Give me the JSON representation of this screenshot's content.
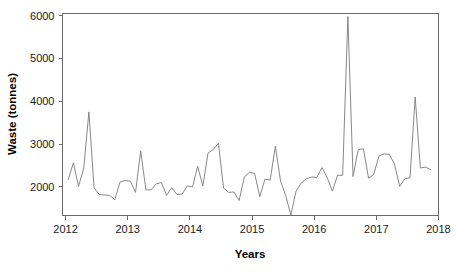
{
  "chart_data": {
    "type": "line",
    "title": "",
    "xlabel": "Years",
    "ylabel": "Waste (tonnes)",
    "xlim": [
      2011.95,
      2018.0
    ],
    "ylim": [
      1330,
      6050
    ],
    "xticks": [
      2012,
      2013,
      2014,
      2015,
      2016,
      2017,
      2018
    ],
    "xtick_labels": [
      "2012",
      "2013",
      "2014",
      "2015",
      "2016",
      "2017",
      "2018"
    ],
    "yticks": [
      2000,
      3000,
      4000,
      5000,
      6000
    ],
    "ytick_labels": [
      "2000",
      "3000",
      "4000",
      "5000",
      "6000"
    ],
    "grid": false,
    "legend": "none",
    "line_color": "#7a7a7a",
    "axis_color": "#6b6b6b",
    "series": [
      {
        "name": "Waste",
        "x": [
          2012.042,
          2012.125,
          2012.208,
          2012.292,
          2012.375,
          2012.458,
          2012.542,
          2012.625,
          2012.708,
          2012.792,
          2012.875,
          2012.958,
          2013.042,
          2013.125,
          2013.208,
          2013.292,
          2013.375,
          2013.458,
          2013.542,
          2013.625,
          2013.708,
          2013.792,
          2013.875,
          2013.958,
          2014.042,
          2014.125,
          2014.208,
          2014.292,
          2014.375,
          2014.458,
          2014.542,
          2014.625,
          2014.708,
          2014.792,
          2014.875,
          2014.958,
          2015.042,
          2015.125,
          2015.208,
          2015.292,
          2015.375,
          2015.458,
          2015.542,
          2015.625,
          2015.708,
          2015.792,
          2015.875,
          2015.958,
          2016.042,
          2016.125,
          2016.208,
          2016.292,
          2016.375,
          2016.458,
          2016.542,
          2016.625,
          2016.708,
          2016.792,
          2016.875,
          2016.958,
          2017.042,
          2017.125,
          2017.208,
          2017.292,
          2017.375,
          2017.458,
          2017.542,
          2017.625,
          2017.708,
          2017.792,
          2017.875
        ],
        "values": [
          2170,
          2560,
          2010,
          2440,
          3750,
          1980,
          1820,
          1810,
          1800,
          1700,
          2110,
          2150,
          2130,
          1870,
          2840,
          1930,
          1930,
          2070,
          2100,
          1800,
          1980,
          1820,
          1830,
          2020,
          2000,
          2480,
          2020,
          2790,
          2870,
          3020,
          1970,
          1870,
          1880,
          1680,
          2230,
          2340,
          2310,
          1770,
          2180,
          2160,
          2950,
          2140,
          1790,
          1340,
          1900,
          2090,
          2190,
          2230,
          2220,
          2450,
          2220,
          1900,
          2270,
          2270,
          5980,
          2240,
          2870,
          2890,
          2200,
          2290,
          2720,
          2770,
          2760,
          2530,
          2010,
          2190,
          2210,
          4100,
          2440,
          2460,
          2400
        ]
      }
    ],
    "peaks": [
      {
        "x": 2012.375,
        "y": 3750,
        "label": "mid-2012 spike"
      },
      {
        "x": 2013.208,
        "y": 2840,
        "label": "early-2013 spike"
      },
      {
        "x": 2014.458,
        "y": 3020,
        "label": "mid-2014 high"
      },
      {
        "x": 2015.375,
        "y": 2950,
        "label": "2015 spike"
      },
      {
        "x": 2015.625,
        "y": 1340,
        "label": "2015 minimum"
      },
      {
        "x": 2016.542,
        "y": 5980,
        "label": "2016 maximum"
      },
      {
        "x": 2017.625,
        "y": 4100,
        "label": "2017 spike"
      },
      {
        "x": 2017.875,
        "y": 3230,
        "label": "late-2017 spike"
      }
    ]
  }
}
